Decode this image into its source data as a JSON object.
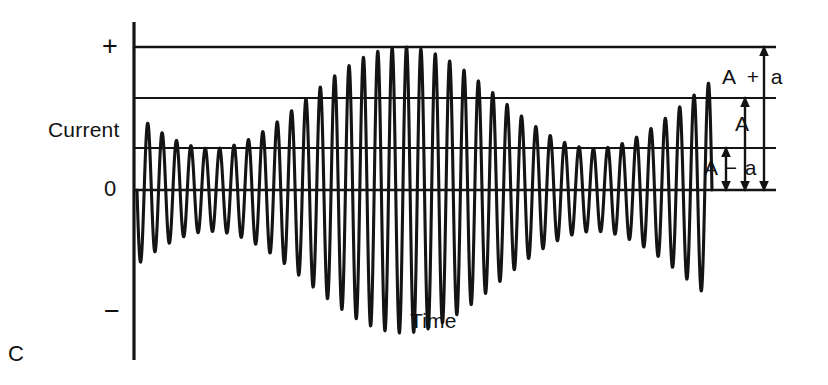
{
  "figure": {
    "panel_label": "C",
    "caption_kind": "amplitude-modulated-wave-diagram",
    "axes": {
      "y_axis_title": "Current",
      "x_axis_title": "Time",
      "y_tick_plus": "+",
      "y_tick_zero": "0",
      "y_tick_minus": "−"
    },
    "annotations": {
      "envelope_max": "A + a",
      "carrier_mean": "A",
      "envelope_min": "A − a"
    },
    "colors": {
      "ink": "#111111",
      "background": "#ffffff",
      "rule": "#141414"
    }
  },
  "chart_data": {
    "type": "line",
    "title": "",
    "subtitle": "",
    "xlabel": "Time",
    "ylabel": "Current",
    "grid": true,
    "legend": false,
    "legend_position": "none",
    "xlim": [
      0,
      1
    ],
    "ylim": [
      -1.15,
      1.15
    ],
    "x_tick_labels": [],
    "y_tick_labels": [
      "+",
      "0",
      "−"
    ],
    "reference_lines": [
      {
        "name": "peak-envelope-line",
        "label": "A + a",
        "y": 1.0
      },
      {
        "name": "upper-carrier-line",
        "label": "",
        "y": 0.645
      },
      {
        "name": "carrier-center-line",
        "label": "A",
        "y": 0.295
      },
      {
        "name": "zero-line",
        "label": "0",
        "y": 0.0
      }
    ],
    "annotations": [
      {
        "name": "A-plus-a",
        "text": "A + a",
        "from_y": 1.0,
        "to_y": 0.0,
        "x": 0.935
      },
      {
        "name": "A",
        "text": "A",
        "from_y": 0.645,
        "to_y": 0.0,
        "x": 0.906
      },
      {
        "name": "A-minus-a",
        "text": "A − a",
        "from_y": 0.295,
        "to_y": 0.0,
        "x": 0.877
      }
    ],
    "series": [
      {
        "name": "modulated-carrier",
        "kind": "amplitude-modulated-sine",
        "carrier_cycles": 40,
        "carrier_phase_deg": 180,
        "envelope": {
          "kind": "sine",
          "mean_A": 0.645,
          "modulation_depth_a": 0.355,
          "cycles": 1.5,
          "phase_deg": 200,
          "min_value": 0.295,
          "max_value": 1.0
        },
        "description": "Carrier oscillation whose peak amplitude swells from A to A+a, shrinks to A−a, then swells back to A+a across the trace."
      }
    ]
  }
}
